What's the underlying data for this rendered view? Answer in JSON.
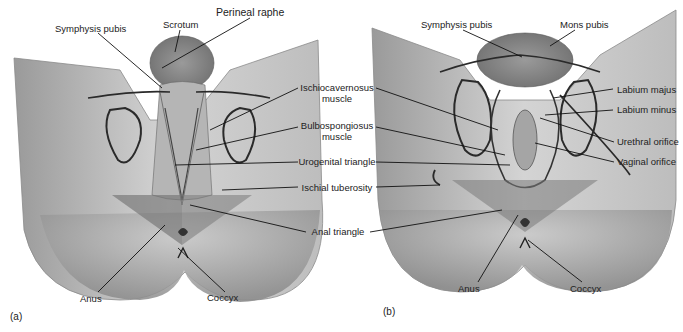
{
  "figure": {
    "panels": [
      {
        "id": "a",
        "label": "(a)",
        "subject": "male perineum",
        "structures": {
          "symphysis_pubis": "Symphysis pubis",
          "scrotum": "Scrotum",
          "perineal_raphe": "Perineal raphe",
          "anus": "Anus",
          "coccyx": "Coccyx"
        }
      },
      {
        "id": "b",
        "label": "(b)",
        "subject": "female perineum",
        "structures": {
          "symphysis_pubis": "Symphysis pubis",
          "mons_pubis": "Mons pubis",
          "labium_majus": "Labium majus",
          "labium_minus": "Labium minus",
          "urethral_orifice": "Urethral orifice",
          "vaginal_orifice": "Vaginal orifice",
          "anus": "Anus",
          "coccyx": "Coccyx"
        }
      }
    ],
    "shared_labels": {
      "ischiocavernosus_1": "Ischiocavernosus",
      "ischiocavernosus_2": "muscle",
      "bulbospongiosus_1": "Bulbospongiosus",
      "bulbospongiosus_2": "muscle",
      "urogenital_triangle": "Urogenital triangle",
      "ischial_tuberosity": "Ischial tuberosity",
      "anal_triangle": "Anal triangle"
    },
    "colors": {
      "skin_light": "#d9d9d9",
      "skin_mid": "#a8a8a8",
      "skin_dark": "#6e6e6e",
      "triangle_overlay": "#7a7a7a",
      "outline": "#2a2a2a",
      "leader_line": "#111111"
    }
  }
}
